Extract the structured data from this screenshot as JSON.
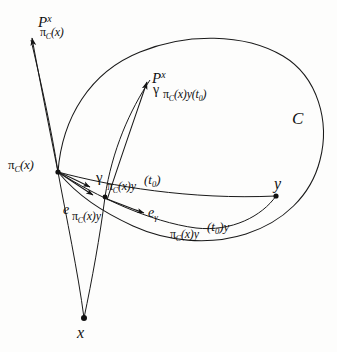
{
  "figure": {
    "kind": "geometry-diagram",
    "background_color": "#fdfdfc",
    "ink_color": "#111111",
    "stroke_width": 1
  },
  "points": [
    {
      "id": "projection",
      "label_pi": "π",
      "label_sub": "C",
      "label_arg": "(x)",
      "x": 58,
      "y": 172
    },
    {
      "id": "gamma-t0",
      "label": "",
      "x": 105,
      "y": 197
    },
    {
      "id": "y",
      "label": "y",
      "x": 276,
      "y": 196
    },
    {
      "id": "x",
      "label": "x",
      "x": 84,
      "y": 318
    }
  ],
  "labels": {
    "region_C": "C",
    "point_y": "y",
    "point_x": "x",
    "parallel_transport_pi": {
      "base": "P",
      "superscript": "x",
      "subscript_pi": "π",
      "subscript_sub": "C",
      "subscript_arg": "(x)"
    },
    "parallel_transport_gamma": {
      "base": "P",
      "superscript": "x",
      "subscript_gamma": "γ",
      "subscript_pi": "π",
      "subscript_sub": "C",
      "subscript_arg": "(x)y",
      "subscript_time": "(t",
      "subscript_time_sub": "0",
      "subscript_time_close": ")"
    },
    "geodesic_point": {
      "gamma": "γ",
      "pi": "π",
      "sub": "C",
      "arg": "(x)y",
      "time_open": "(t",
      "time_sub": "0",
      "time_close": ")"
    },
    "unit_vector_pi": {
      "e": "e",
      "pi": "π",
      "sub": "C",
      "arg": "(x)y"
    },
    "unit_vector_gamma": {
      "e": "e",
      "gamma": "γ"
    },
    "geodesic_curve": {
      "pi": "π",
      "sub": "C",
      "arg": "(x)y",
      "time_open": "(t",
      "time_sub": "0",
      "time_close": ")y"
    },
    "projection_point": {
      "pi": "π",
      "sub": "C",
      "arg": "(x)"
    }
  }
}
